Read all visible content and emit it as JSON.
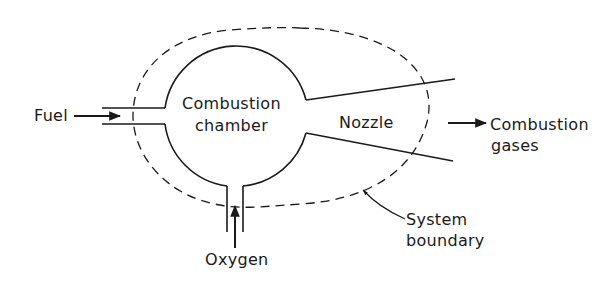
{
  "diagram": {
    "type": "control-volume schematic",
    "labels": {
      "fuel": "Fuel",
      "chamber_line1": "Combustion",
      "chamber_line2": "chamber",
      "nozzle": "Nozzle",
      "gases_line1": "Combustion",
      "gases_line2": "gases",
      "oxygen": "Oxygen",
      "boundary_line1": "System",
      "boundary_line2": "boundary"
    },
    "colors": {
      "stroke": "#1a1a1a",
      "background": "#ffffff"
    }
  }
}
